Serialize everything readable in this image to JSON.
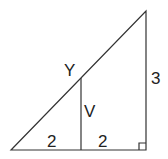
{
  "diagram": {
    "labels": {
      "hypotenuse": "Y",
      "inner_segment": "V",
      "right_side": "3",
      "base_left": "2",
      "base_right": "2"
    },
    "right_angle_marker": true,
    "colors": {
      "stroke": "#333333",
      "text": "#222222",
      "background": "#ffffff"
    }
  }
}
